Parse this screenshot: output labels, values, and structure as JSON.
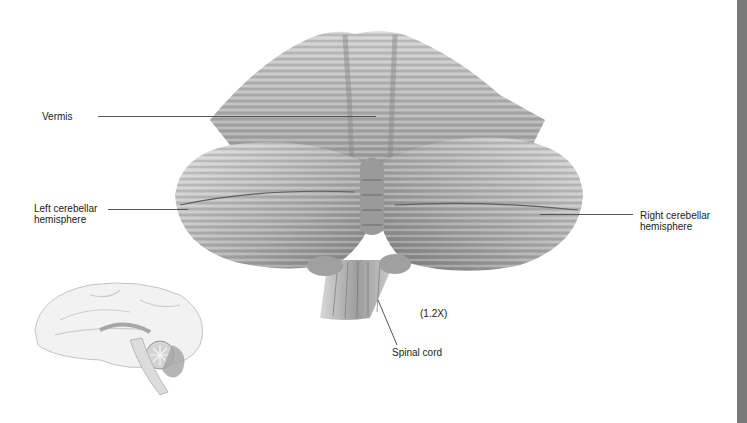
{
  "figure": {
    "magnification": "(1.2X)",
    "labels": {
      "vermis": "Vermis",
      "left_hemisphere_line1": "Left cerebellar",
      "left_hemisphere_line2": "hemisphere",
      "right_hemisphere_line1": "Right cerebellar",
      "right_hemisphere_line2": "hemisphere",
      "spinal_cord": "Spinal cord"
    },
    "colors": {
      "background": "#ffffff",
      "tissue_light": "#e6e6e6",
      "tissue_mid": "#a8a8a8",
      "tissue_dark": "#6e6e6e",
      "side_bar": "#7a7a7a",
      "leader_line": "#555555"
    }
  }
}
